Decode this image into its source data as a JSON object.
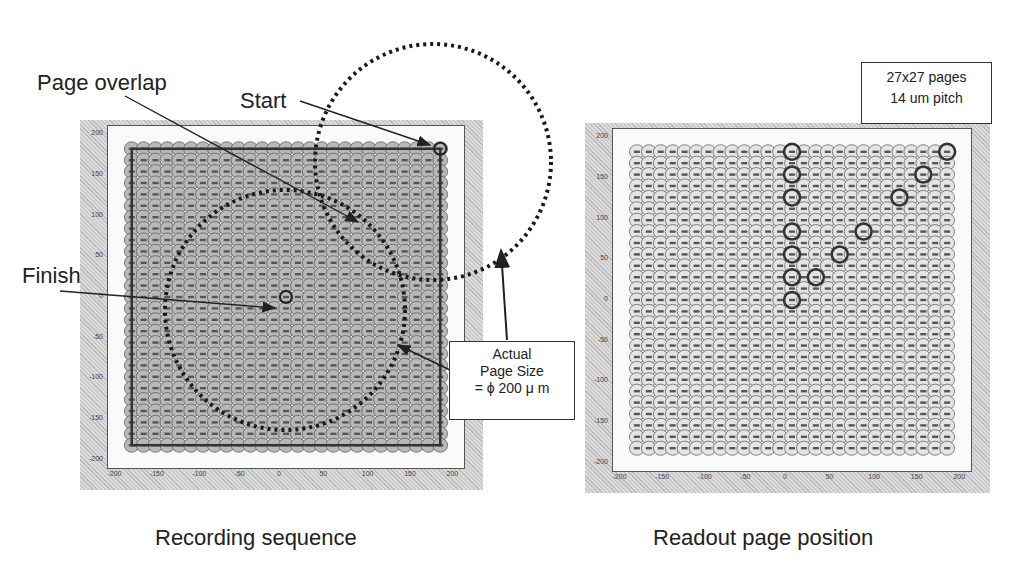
{
  "figure": {
    "left_panel": {
      "caption": "Recording sequence",
      "x_ticks": [
        "-200",
        "-150",
        "-100",
        "-50",
        "0",
        "50",
        "100",
        "150",
        "200"
      ],
      "y_ticks": [
        "200",
        "150",
        "100",
        "50",
        "0",
        "-50",
        "-100",
        "-150",
        "-200"
      ],
      "annotations": {
        "page_overlap": "Page overlap",
        "start": "Start",
        "finish": "Finish"
      }
    },
    "right_panel": {
      "caption": "Readout page position",
      "x_ticks": [
        "-200",
        "-150",
        "-100",
        "-50",
        "0",
        "50",
        "100",
        "150",
        "200"
      ],
      "y_ticks": [
        "200",
        "150",
        "100",
        "50",
        "0",
        "-50",
        "-100",
        "-150",
        "-200"
      ],
      "info_box": {
        "line1": "27x27 pages",
        "line2": "14 um pitch"
      }
    },
    "page_size_box": {
      "line1": "Actual",
      "line2": "Page Size",
      "line3": "= ϕ 200 μ m"
    },
    "grid": {
      "rows": 27,
      "cols": 27,
      "pitch_um": 14,
      "extent_um": 182,
      "circle_color": "#555555",
      "fill_color": "#e4e4e4"
    },
    "highlighted_readout_positions": [
      [
        0,
        182
      ],
      [
        182,
        182
      ],
      [
        0,
        154
      ],
      [
        154,
        154
      ],
      [
        0,
        126
      ],
      [
        126,
        126
      ],
      [
        0,
        84
      ],
      [
        84,
        84
      ],
      [
        0,
        56
      ],
      [
        56,
        56
      ],
      [
        0,
        28
      ],
      [
        28,
        28
      ],
      [
        0,
        0
      ]
    ]
  }
}
